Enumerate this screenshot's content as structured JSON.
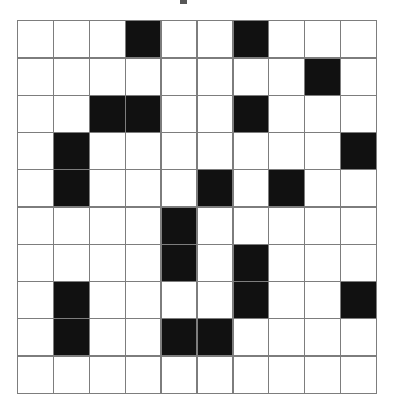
{
  "figure": {
    "type": "binary-grid",
    "title": "",
    "rows": 10,
    "cols": 10,
    "cell_states": [
      [
        0,
        0,
        0,
        1,
        0,
        0,
        1,
        0,
        0,
        0
      ],
      [
        0,
        0,
        0,
        0,
        0,
        0,
        0,
        0,
        1,
        0
      ],
      [
        0,
        0,
        1,
        1,
        0,
        0,
        1,
        0,
        0,
        0
      ],
      [
        0,
        1,
        0,
        0,
        0,
        0,
        0,
        0,
        0,
        1
      ],
      [
        0,
        1,
        0,
        0,
        0,
        1,
        0,
        1,
        0,
        0
      ],
      [
        0,
        0,
        0,
        0,
        1,
        0,
        0,
        0,
        0,
        0
      ],
      [
        0,
        0,
        0,
        0,
        1,
        0,
        1,
        0,
        0,
        0
      ],
      [
        0,
        1,
        0,
        0,
        0,
        0,
        1,
        0,
        0,
        1
      ],
      [
        0,
        1,
        0,
        0,
        1,
        1,
        0,
        0,
        0,
        0
      ],
      [
        0,
        0,
        0,
        0,
        0,
        0,
        0,
        0,
        0,
        0
      ]
    ],
    "filled_count": 19,
    "empty_count": 81,
    "filled_cells": [
      {
        "row": 1,
        "col": 4
      },
      {
        "row": 1,
        "col": 7
      },
      {
        "row": 2,
        "col": 9
      },
      {
        "row": 3,
        "col": 3
      },
      {
        "row": 3,
        "col": 4
      },
      {
        "row": 3,
        "col": 7
      },
      {
        "row": 4,
        "col": 2
      },
      {
        "row": 4,
        "col": 10
      },
      {
        "row": 5,
        "col": 2
      },
      {
        "row": 5,
        "col": 6
      },
      {
        "row": 5,
        "col": 8
      },
      {
        "row": 6,
        "col": 5
      },
      {
        "row": 7,
        "col": 5
      },
      {
        "row": 7,
        "col": 7
      },
      {
        "row": 8,
        "col": 2
      },
      {
        "row": 8,
        "col": 7
      },
      {
        "row": 8,
        "col": 10
      },
      {
        "row": 9,
        "col": 2
      },
      {
        "row": 9,
        "col": 5
      },
      {
        "row": 9,
        "col": 6
      }
    ],
    "colors": {
      "filled": "#111111",
      "empty": "#ffffff",
      "gridline": "#7d7d7d",
      "background": "#ffffff"
    }
  },
  "chart_data": {
    "type": "heatmap",
    "title": "",
    "xlabel": "",
    "ylabel": "",
    "categories": [
      "1",
      "2",
      "3",
      "4",
      "5",
      "6",
      "7",
      "8",
      "9",
      "10"
    ],
    "row_labels": [
      "1",
      "2",
      "3",
      "4",
      "5",
      "6",
      "7",
      "8",
      "9",
      "10"
    ],
    "values": [
      [
        0,
        0,
        0,
        1,
        0,
        0,
        1,
        0,
        0,
        0
      ],
      [
        0,
        0,
        0,
        0,
        0,
        0,
        0,
        0,
        1,
        0
      ],
      [
        0,
        0,
        1,
        1,
        0,
        0,
        1,
        0,
        0,
        0
      ],
      [
        0,
        1,
        0,
        0,
        0,
        0,
        0,
        0,
        0,
        1
      ],
      [
        0,
        1,
        0,
        0,
        0,
        1,
        0,
        1,
        0,
        0
      ],
      [
        0,
        0,
        0,
        0,
        1,
        0,
        0,
        0,
        0,
        0
      ],
      [
        0,
        0,
        0,
        0,
        1,
        0,
        1,
        0,
        0,
        0
      ],
      [
        0,
        1,
        0,
        0,
        0,
        0,
        1,
        0,
        0,
        1
      ],
      [
        0,
        1,
        0,
        0,
        1,
        1,
        0,
        0,
        0,
        0
      ],
      [
        0,
        0,
        0,
        0,
        0,
        0,
        0,
        0,
        0,
        0
      ]
    ],
    "colorscale": [
      "#ffffff",
      "#111111"
    ],
    "zlim": [
      0,
      1
    ],
    "grid": true,
    "legend": "none"
  }
}
